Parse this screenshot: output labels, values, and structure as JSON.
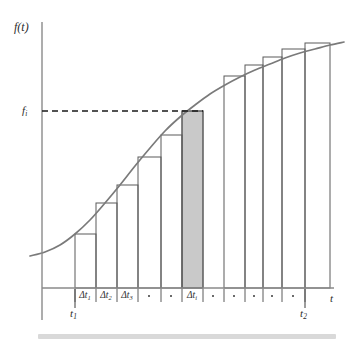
{
  "figure": {
    "title_visible": false,
    "axis_labels": {
      "y": "f(t)",
      "x": "t"
    },
    "y_tick_label": "f",
    "y_tick_sub": "i",
    "x_start_label": "t",
    "x_start_sub": "1",
    "x_end_label": "t",
    "x_end_sub": "2",
    "delta": "Δt",
    "dot": "•",
    "colors": {
      "curve": "#7a7a7a",
      "axis": "#8a8a8a",
      "bar_stroke": "#5a5a5a",
      "shaded_fill": "#c9c9c9",
      "dashed": "#1a1a1a",
      "bottom_bar": "#d9d9d9",
      "text": "#2b2b2b"
    }
  },
  "chart_data": {
    "type": "area",
    "title": "",
    "xlabel": "t",
    "ylabel": "f(t)",
    "grid": false,
    "legend": null,
    "curve": {
      "name": "f(t)",
      "points_px": [
        [
          30,
          256
        ],
        [
          45,
          252
        ],
        [
          60,
          245
        ],
        [
          75,
          234
        ],
        [
          90,
          220
        ],
        [
          105,
          203
        ],
        [
          120,
          185
        ],
        [
          135,
          166
        ],
        [
          150,
          148
        ],
        [
          165,
          131
        ],
        [
          180,
          117
        ],
        [
          195,
          105
        ],
        [
          210,
          94
        ],
        [
          225,
          85
        ],
        [
          240,
          77
        ],
        [
          255,
          70
        ],
        [
          270,
          64
        ],
        [
          285,
          58
        ],
        [
          300,
          53
        ],
        [
          315,
          49
        ],
        [
          330,
          45
        ],
        [
          344,
          42
        ]
      ]
    },
    "axis_px": {
      "x_axis_y": 288,
      "y_axis_x": 42,
      "y_axis_top": 22,
      "y_axis_bottom": 320,
      "x_axis_right": 334
    },
    "fi_level_px": 111,
    "dashed_line_px": {
      "x1": 42,
      "x2": 203,
      "y": 111
    },
    "t1_px": 75,
    "t2_px": 305,
    "ticks_px": [
      75,
      96,
      117,
      138,
      161,
      182,
      203,
      224,
      245,
      263,
      282,
      305
    ],
    "shaded_bar": {
      "index": 6,
      "x0_px": 182,
      "x1_px": 203,
      "top_px": 111
    },
    "bars_px": [
      {
        "x0": 75,
        "x1": 96,
        "top": 234
      },
      {
        "x0": 96,
        "x1": 117,
        "top": 203
      },
      {
        "x0": 117,
        "x1": 138,
        "top": 185
      },
      {
        "x0": 138,
        "x1": 161,
        "top": 157
      },
      {
        "x0": 161,
        "x1": 182,
        "top": 135
      },
      {
        "x0": 182,
        "x1": 203,
        "top": 111
      },
      {
        "x0": 203,
        "x1": 224,
        "top": 91
      },
      {
        "x0": 224,
        "x1": 245,
        "top": 76
      },
      {
        "x0": 245,
        "x1": 263,
        "top": 65
      },
      {
        "x0": 263,
        "x1": 282,
        "top": 57
      },
      {
        "x0": 282,
        "x1": 305,
        "top": 49
      },
      {
        "x0": 305,
        "x1": 330,
        "top": 43
      }
    ],
    "interval_labels": [
      {
        "type": "delta",
        "text": "Δt",
        "sub": "1",
        "center_px": 85
      },
      {
        "type": "delta",
        "text": "Δt",
        "sub": "2",
        "center_px": 106
      },
      {
        "type": "delta",
        "text": "Δt",
        "sub": "3",
        "center_px": 127
      },
      {
        "type": "dot",
        "text": "•",
        "sub": "",
        "center_px": 149
      },
      {
        "type": "dot",
        "text": "•",
        "sub": "",
        "center_px": 171
      },
      {
        "type": "delta",
        "text": "Δt",
        "sub": "i",
        "center_px": 192
      },
      {
        "type": "dot",
        "text": "•",
        "sub": "",
        "center_px": 213
      },
      {
        "type": "dot",
        "text": "•",
        "sub": "",
        "center_px": 234
      },
      {
        "type": "dot",
        "text": "•",
        "sub": "",
        "center_px": 254
      },
      {
        "type": "dot",
        "text": "•",
        "sub": "",
        "center_px": 272
      },
      {
        "type": "dot",
        "text": "•",
        "sub": "",
        "center_px": 293
      }
    ]
  }
}
